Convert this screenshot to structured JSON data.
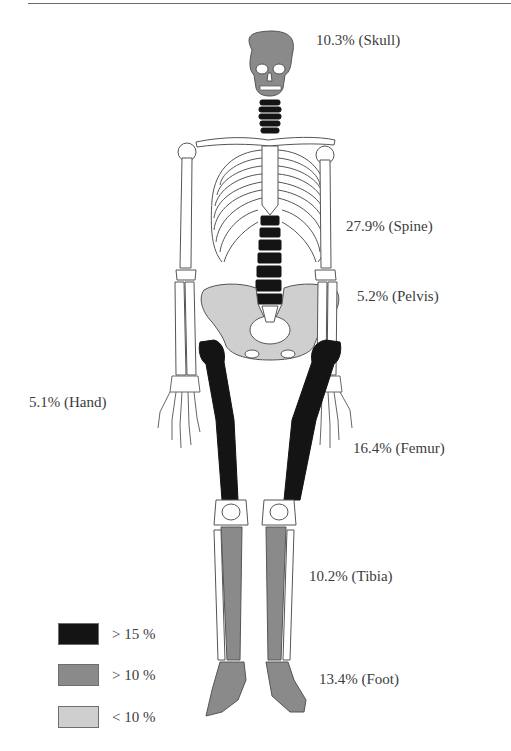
{
  "figure": {
    "labels": {
      "skull": "10.3% (Skull)",
      "spine": "27.9% (Spine)",
      "pelvis": "5.2% (Pelvis)",
      "hand": "5.1% (Hand)",
      "femur": "16.4% (Femur)",
      "tibia": "10.2% (Tibia)",
      "foot": "13.4% (Foot)"
    },
    "regions": [
      {
        "name": "Skull",
        "percent": 10.3,
        "category": "> 10 %"
      },
      {
        "name": "Spine",
        "percent": 27.9,
        "category": "> 15 %"
      },
      {
        "name": "Pelvis",
        "percent": 5.2,
        "category": "< 10 %"
      },
      {
        "name": "Hand",
        "percent": 5.1,
        "category": "< 10 %"
      },
      {
        "name": "Femur",
        "percent": 16.4,
        "category": "> 15 %"
      },
      {
        "name": "Tibia",
        "percent": 10.2,
        "category": "> 10 %"
      },
      {
        "name": "Foot",
        "percent": 13.4,
        "category": "> 10 %"
      }
    ]
  },
  "legend": {
    "items": [
      {
        "label": "> 15 %",
        "color": "#141414"
      },
      {
        "label": "> 10 %",
        "color": "#8a8a8a"
      },
      {
        "label": "< 10 %",
        "color": "#cfcfcf"
      }
    ]
  },
  "colors": {
    "high": "#141414",
    "medium": "#8a8a8a",
    "low": "#cfcfcf",
    "outline": "#555555",
    "bone_white": "#ffffff"
  }
}
